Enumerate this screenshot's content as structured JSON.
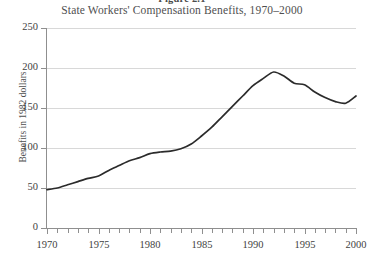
{
  "figure": {
    "number_label": "Figure 2.1",
    "title": "State Workers' Compensation Benefits, 1970–2000"
  },
  "chart_data": {
    "type": "line",
    "title": "State Workers' Compensation Benefits, 1970–2000",
    "subtitle": "Figure 2.1",
    "xlabel": "",
    "ylabel": "Benefits in 1982 dollars",
    "xlim": [
      1970,
      2000
    ],
    "ylim": [
      0,
      250
    ],
    "ytick_labels": [
      "0",
      "50",
      "100",
      "150",
      "200",
      "250"
    ],
    "yticks": [
      0,
      50,
      100,
      150,
      200,
      250
    ],
    "xtick_labels": [
      "1970",
      "1975",
      "1980",
      "1985",
      "1990",
      "1995",
      "2000"
    ],
    "xticks": [
      1970,
      1975,
      1980,
      1985,
      1990,
      1995,
      2000
    ],
    "xtick_minor_step": 1,
    "grid": "horizontal",
    "legend": "none",
    "line_color": "#2b2b2b",
    "x": [
      1970,
      1971,
      1972,
      1973,
      1974,
      1975,
      1976,
      1977,
      1978,
      1979,
      1980,
      1981,
      1982,
      1983,
      1984,
      1985,
      1986,
      1987,
      1988,
      1989,
      1990,
      1991,
      1992,
      1993,
      1994,
      1995,
      1996,
      1997,
      1998,
      1999,
      2000
    ],
    "values": [
      48,
      50,
      54,
      58,
      62,
      65,
      72,
      78,
      84,
      88,
      93,
      95,
      96,
      99,
      105,
      115,
      126,
      139,
      152,
      165,
      178,
      187,
      195,
      190,
      181,
      179,
      170,
      163,
      158,
      156,
      165
    ],
    "series": [
      {
        "name": "Benefits in 1982 dollars",
        "values": [
          48,
          50,
          54,
          58,
          62,
          65,
          72,
          78,
          84,
          88,
          93,
          95,
          96,
          99,
          105,
          115,
          126,
          139,
          152,
          165,
          178,
          187,
          195,
          190,
          181,
          179,
          170,
          163,
          158,
          156,
          165
        ]
      }
    ]
  }
}
